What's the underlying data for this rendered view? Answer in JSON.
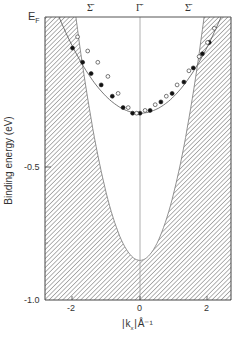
{
  "chart_data": {
    "type": "scatter",
    "title": "",
    "xlabel": "|k_x| Å⁻¹",
    "ylabel": "Binding energy (eV)",
    "xlim": [
      -2.8,
      2.8
    ],
    "ylim": [
      -1.0,
      0.0
    ],
    "x_ticks": [
      -2,
      0,
      2
    ],
    "x_tick_labels": [
      "-2",
      "0",
      "2"
    ],
    "y_ticks": [
      0.0,
      -0.5,
      -1.0
    ],
    "y_tick_labels": [
      "E_F",
      "-0.5",
      "-1.0"
    ],
    "top_labels": [
      {
        "x": -1.4,
        "label": "Σ̄"
      },
      {
        "x": 0.0,
        "label": "Γ̄"
      },
      {
        "x": 1.4,
        "label": "Σ̄"
      }
    ],
    "grid": false,
    "legend": "none",
    "series": [
      {
        "name": "filled circles",
        "marker": "filled-circle",
        "points": [
          [
            -2.0,
            -0.11
          ],
          [
            -1.7,
            -0.16
          ],
          [
            -1.45,
            -0.2
          ],
          [
            -1.15,
            -0.24
          ],
          [
            -0.82,
            -0.28
          ],
          [
            -0.5,
            -0.32
          ],
          [
            -0.22,
            -0.34
          ],
          [
            0.0,
            -0.34
          ],
          [
            0.3,
            -0.33
          ],
          [
            0.62,
            -0.3
          ],
          [
            0.95,
            -0.27
          ],
          [
            1.3,
            -0.23
          ],
          [
            1.58,
            -0.18
          ],
          [
            1.85,
            -0.13
          ],
          [
            2.05,
            -0.09
          ]
        ]
      },
      {
        "name": "open circles",
        "marker": "open-circle",
        "points": [
          [
            -1.85,
            -0.07
          ],
          [
            -1.55,
            -0.12
          ],
          [
            -1.25,
            -0.16
          ],
          [
            -0.95,
            -0.21
          ],
          [
            -0.65,
            -0.27
          ],
          [
            -0.35,
            -0.32
          ],
          [
            -0.1,
            -0.34
          ],
          [
            0.15,
            -0.33
          ],
          [
            0.45,
            -0.31
          ],
          [
            0.78,
            -0.28
          ],
          [
            1.1,
            -0.24
          ],
          [
            1.45,
            -0.19
          ],
          [
            1.75,
            -0.14
          ],
          [
            2.0,
            -0.09
          ],
          [
            2.2,
            -0.04
          ]
        ]
      }
    ],
    "fit_curve": {
      "type": "parabola",
      "vertex": [
        0.0,
        -0.34
      ],
      "crosses_EF_at": [
        -2.4,
        2.4
      ]
    },
    "shaded_region": {
      "description": "hatched projected bulk band region",
      "boundary_min": [
        0.0,
        -0.86
      ],
      "boundary_EF_crossing": [
        -1.9,
        1.9
      ]
    }
  },
  "labels": {
    "ef": "E",
    "ef_sub": "F",
    "y_mid": "-0.5",
    "y_bottom": "-1.0",
    "x_neg2": "-2",
    "x_zero": "0",
    "x_pos2": "2",
    "xlabel_k": "k",
    "xlabel_sub": "x",
    "xlabel_unit": "Å⁻¹",
    "ylabel": "Binding energy (eV)",
    "sigma_left": "Σ̄",
    "gamma": "Γ̄",
    "sigma_right": "Σ̄"
  }
}
